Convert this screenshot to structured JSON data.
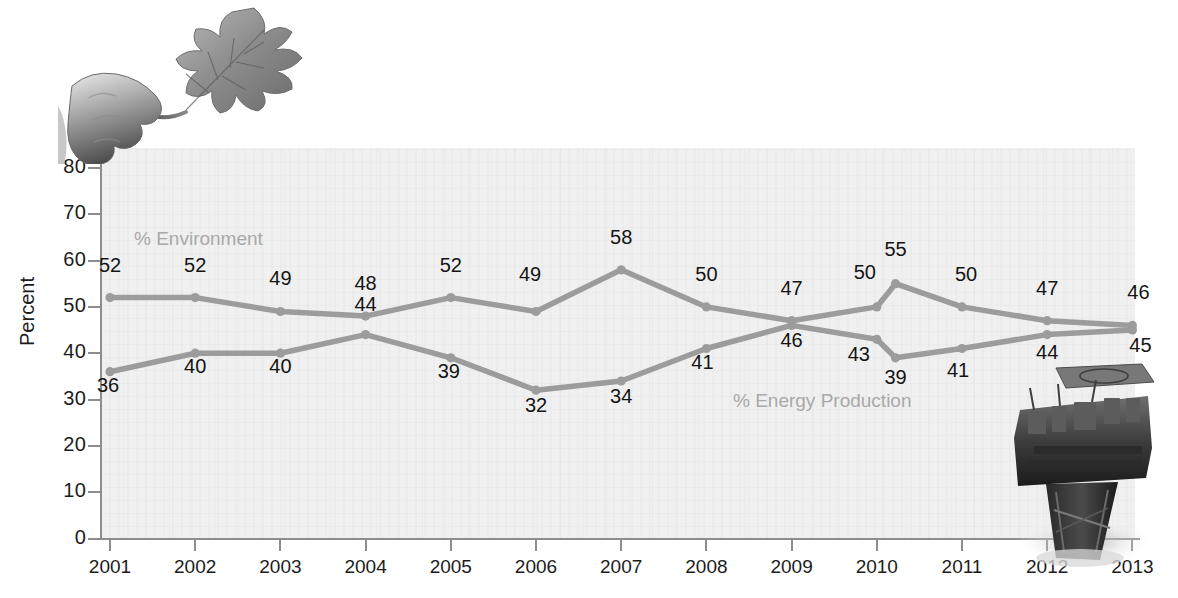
{
  "chart_data": {
    "type": "line",
    "title": "",
    "xlabel": "",
    "ylabel": "Percent",
    "ylim": [
      0,
      80
    ],
    "yticks": [
      0,
      10,
      20,
      30,
      40,
      50,
      60,
      70,
      80
    ],
    "categories": [
      "2001",
      "2002",
      "2003",
      "2004",
      "2005",
      "2006",
      "2007",
      "2008",
      "2009",
      "2010",
      "2010b",
      "2011",
      "2012",
      "2013"
    ],
    "tick_labels": [
      "2001",
      "2002",
      "2003",
      "2004",
      "2005",
      "2006",
      "2007",
      "2008",
      "2009",
      "2010",
      "2011",
      "2012",
      "2013"
    ],
    "grid": false,
    "legend_position": "inline",
    "series": [
      {
        "name": "% Environment",
        "color": "#9c9c9c",
        "values": [
          52,
          52,
          49,
          48,
          52,
          49,
          58,
          50,
          47,
          50,
          55,
          50,
          47,
          46
        ],
        "labels": [
          "52",
          "52",
          "49",
          "48",
          "52",
          "49",
          "58",
          "50",
          "47",
          "50",
          "55",
          "50",
          "47",
          "46"
        ]
      },
      {
        "name": "% Energy Production",
        "color": "#9c9c9c",
        "values": [
          36,
          40,
          40,
          44,
          39,
          32,
          34,
          41,
          46,
          43,
          39,
          41,
          44,
          45
        ],
        "labels": [
          "36",
          "40",
          "40",
          "44",
          "39",
          "32",
          "34",
          "41",
          "46",
          "43",
          "39",
          "41",
          "44",
          "45"
        ]
      }
    ]
  },
  "decorations": {
    "leaf_photo_alt": "hand-holding-oak-leaf-photo",
    "rig_photo_alt": "offshore-oil-rig-photo"
  },
  "colors": {
    "line": "#9c9c9c",
    "marker": "#9c9c9c",
    "plot_background": "#f0f0f0",
    "axis": "#8d8d8d",
    "label_text": "#141414",
    "series_label_text": "#a9a9a9"
  }
}
